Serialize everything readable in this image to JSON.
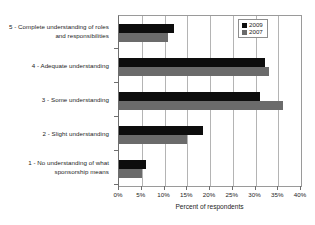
{
  "chart_data": {
    "type": "bar",
    "orientation": "horizontal",
    "title": "",
    "xlabel": "Percent of respondents",
    "ylabel": "",
    "xlim": [
      0,
      40
    ],
    "xtick_labels": [
      "0%",
      "5%",
      "10%",
      "15%",
      "20%",
      "25%",
      "30%",
      "35%",
      "40%"
    ],
    "xtick_values": [
      0,
      5,
      10,
      15,
      20,
      25,
      30,
      35,
      40
    ],
    "grid": true,
    "legend_position": "top-right",
    "categories": [
      "5 - Complete understanding of roles and responsibilities",
      "4 - Adequate understanding",
      "3 - Some understanding",
      "2 - Slight understanding",
      "1 - No understanding of what sponsorship means"
    ],
    "series": [
      {
        "name": "2009",
        "color": "#0d0d0d",
        "values": [
          12.0,
          32.0,
          31.0,
          18.5,
          6.0
        ]
      },
      {
        "name": "2007",
        "color": "#6b6b6b",
        "values": [
          10.8,
          33.0,
          36.0,
          15.0,
          5.0
        ]
      }
    ]
  },
  "legend": {
    "items": [
      {
        "label": "2009"
      },
      {
        "label": "2007"
      }
    ]
  }
}
